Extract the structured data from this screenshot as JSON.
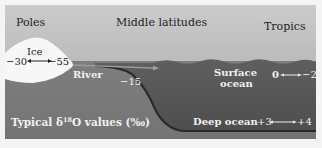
{
  "regions": {
    "poles": "Poles",
    "middle": "Middle latitudes",
    "tropics": "Tropics"
  },
  "reservoirs": {
    "ice": {
      "label": "Ice",
      "min": "−30",
      "max": "−55"
    },
    "river": {
      "label": "River",
      "value": "−15"
    },
    "surface_ocean": {
      "label_line1": "Surface",
      "label_line2": "ocean",
      "min": "0",
      "max": "−2"
    },
    "deep_ocean": {
      "label": "Deep ocean",
      "min": "+3",
      "max": "+4"
    }
  },
  "caption": {
    "prefix": "Typical δ",
    "superscript": "18",
    "suffix": "O values (‰)"
  },
  "colors": {
    "sky_top": "#c9c9c9",
    "sky_bottom": "#a9a9a9",
    "land": "#7b7b7b",
    "ocean": "#5c5c5c",
    "ice": "#f7f7f7",
    "text_light": "#f2f2f2",
    "text_dark": "#1e1e1e"
  }
}
